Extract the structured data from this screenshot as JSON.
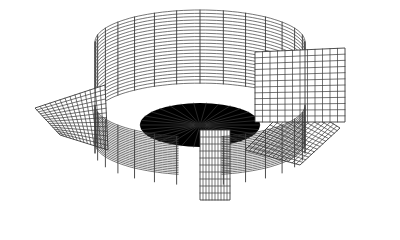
{
  "figure": {
    "background": "#ffffff",
    "line_color": "#3a3a3a",
    "width": 400,
    "height": 240
  },
  "cylinder": {
    "cx": 200,
    "rx": 105,
    "ry": 32,
    "top_y": 42,
    "bottom_y": 175,
    "horizontal_rings": 22,
    "vertical_segments": 28,
    "open_gap_start_deg": 80,
    "open_gap_end_deg": 100
  },
  "center": {
    "x": 200,
    "y": 125,
    "radial_lines": 30,
    "rings": 10,
    "ring_rx": 60,
    "ring_ry": 22
  },
  "flaps": [
    {
      "name": "left-flap",
      "points": [
        [
          35,
          108
        ],
        [
          105,
          85
        ],
        [
          108,
          150
        ],
        [
          60,
          135
        ]
      ],
      "hatch": 14
    },
    {
      "name": "right-flap",
      "points": [
        [
          295,
          100
        ],
        [
          340,
          128
        ],
        [
          300,
          165
        ],
        [
          245,
          150
        ]
      ],
      "hatch": 14
    },
    {
      "name": "right-wall-panel",
      "points": [
        [
          255,
          52
        ],
        [
          345,
          48
        ],
        [
          345,
          122
        ],
        [
          255,
          122
        ]
      ],
      "hatch": 12
    },
    {
      "name": "front-panel",
      "points": [
        [
          200,
          130
        ],
        [
          230,
          130
        ],
        [
          230,
          200
        ],
        [
          200,
          200
        ]
      ],
      "hatch": 10
    }
  ]
}
